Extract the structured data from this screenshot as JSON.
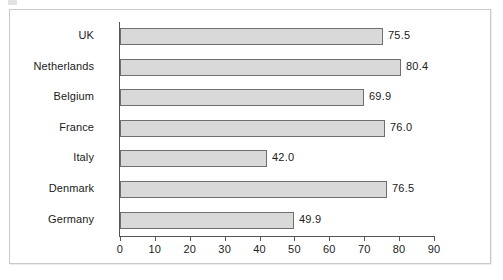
{
  "figure": {
    "background_color": "#ffffff",
    "frame_border_color": "#c9c9c9",
    "bar_fill_color": "#d9d9d9",
    "bar_border_color": "#6f6f6f",
    "axis_color": "#555555"
  },
  "chart_data": {
    "type": "bar",
    "orientation": "horizontal",
    "title": "",
    "xlabel": "",
    "ylabel": "",
    "categories": [
      "UK",
      "Netherlands",
      "Belgium",
      "France",
      "Italy",
      "Denmark",
      "Germany"
    ],
    "values": [
      75.5,
      80.4,
      69.9,
      76.0,
      42.0,
      76.5,
      49.9
    ],
    "value_labels": [
      "75.5",
      "80.4",
      "69.9",
      "76.0",
      "42.0",
      "76.5",
      "49.9"
    ],
    "xlim": [
      0,
      90
    ],
    "xticks": [
      0,
      10,
      20,
      30,
      40,
      50,
      60,
      70,
      80,
      90
    ],
    "xtick_labels": [
      "0",
      "10",
      "20",
      "30",
      "40",
      "50",
      "60",
      "70",
      "80",
      "90"
    ],
    "grid": false,
    "legend": null,
    "legend_position": "none"
  }
}
